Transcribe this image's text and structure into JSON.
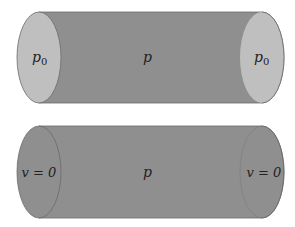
{
  "colors": {
    "background": "#ffffff",
    "body_fill": "#8f8f8f",
    "cap_fill_light": "#bfbfbf",
    "cap_fill_dark": "#8f8f8f",
    "outline": "#6a6a6a",
    "text": "#222222"
  },
  "cylinders": [
    {
      "id": "top",
      "left_cap_label": "p",
      "left_cap_sub": "0",
      "center_label": "p",
      "right_cap_label": "p",
      "right_cap_sub": "0"
    },
    {
      "id": "bottom",
      "left_cap_label": "v = 0",
      "center_label": "p",
      "right_cap_label": "v = 0"
    }
  ]
}
